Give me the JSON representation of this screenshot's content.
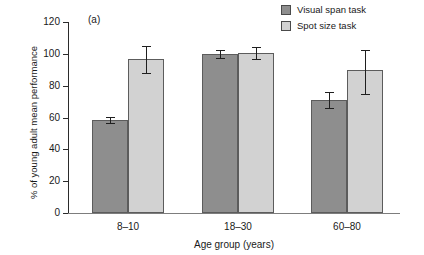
{
  "chart_data": {
    "type": "bar",
    "title": "",
    "panel_label": "(a)",
    "xlabel": "Age group (years)",
    "ylabel": "% of young adult mean performance",
    "categories": [
      "8–10",
      "18–30",
      "60–80"
    ],
    "ylim": [
      0,
      120
    ],
    "yticks": [
      0,
      20,
      40,
      60,
      80,
      100,
      120
    ],
    "ytick_labels": [
      "0",
      "20",
      "40",
      "60",
      "80",
      "100",
      "120"
    ],
    "grid": false,
    "legend_position": "top-right",
    "series": [
      {
        "name": "Visual span task",
        "color": "#8e8e8e",
        "values": [
          58.5,
          100.0,
          71.0
        ],
        "err_low": [
          2.0,
          2.5,
          5.0
        ],
        "err_high": [
          2.0,
          2.5,
          5.0
        ]
      },
      {
        "name": "Spot size task",
        "color": "#d2d2d2",
        "values": [
          96.5,
          100.5,
          90.0
        ],
        "err_low": [
          8.5,
          3.5,
          15.0
        ],
        "err_high": [
          8.5,
          3.5,
          12.5
        ]
      }
    ]
  },
  "legend": {
    "items": [
      {
        "label": "Visual span task",
        "color": "#8e8e8e"
      },
      {
        "label": "Spot size task",
        "color": "#d2d2d2"
      }
    ]
  }
}
